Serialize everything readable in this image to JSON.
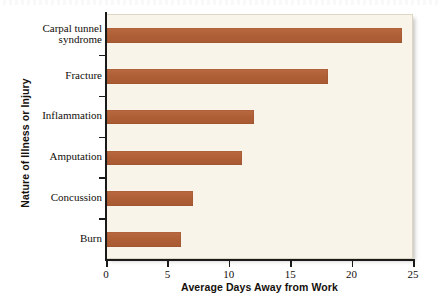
{
  "chart_data": {
    "type": "bar",
    "orientation": "horizontal",
    "title": "",
    "xlabel": "Average Days Away from Work",
    "ylabel": "Nature of Illness or Injury",
    "categories": [
      "Carpal tunnel syndrome",
      "Fracture",
      "Inflammation",
      "Amputation",
      "Concussion",
      "Burn"
    ],
    "category_lines": [
      [
        "Carpal tunnel",
        "syndrome"
      ],
      [
        "Fracture"
      ],
      [
        "Inflammation"
      ],
      [
        "Amputation"
      ],
      [
        "Concussion"
      ],
      [
        "Burn"
      ]
    ],
    "values": [
      24,
      18,
      12,
      11,
      7,
      6
    ],
    "xlim": [
      0,
      25
    ],
    "xticks": [
      0,
      5,
      10,
      15,
      20,
      25
    ],
    "xtick_labels": [
      "0",
      "5",
      "10",
      "15",
      "20",
      "25"
    ],
    "grid": false,
    "legend": false,
    "bar_color": "#ae5e35",
    "panel_color": "#f8f4e9",
    "axis_color": "#1a1a1a"
  }
}
